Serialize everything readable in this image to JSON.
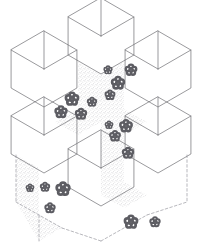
{
  "figure": {
    "title": "Isometric hexagonal tiling",
    "medium": "pen and ink line art",
    "background_color": "#ffffff",
    "line_color": "#6e6e72",
    "dashed_line_color": "#9a9aa0",
    "stipple_color": "#7b7b80",
    "motif_color": "#5d5d63",
    "canvas": {
      "width": 203,
      "height": 245
    },
    "counts": {
      "hexagons": 6,
      "stippled_faces": 7,
      "flower_motifs": 18,
      "dashed_segments": 7
    }
  },
  "geometry": {
    "hexagons": [
      {
        "name": "hexagon-top-center",
        "cx": 101,
        "cy": 36,
        "fill": "plain"
      },
      {
        "name": "hexagon-upper-left",
        "cx": 44,
        "cy": 69,
        "fill": "plain"
      },
      {
        "name": "hexagon-upper-right",
        "cx": 158,
        "cy": 69,
        "fill": "plain"
      },
      {
        "name": "hexagon-lower-left",
        "cx": 44,
        "cy": 135,
        "fill": "plain"
      },
      {
        "name": "hexagon-lower-right",
        "cx": 158,
        "cy": 135,
        "fill": "plain"
      },
      {
        "name": "hexagon-bottom-center",
        "cx": 101,
        "cy": 168,
        "fill": "plain"
      }
    ],
    "hexagon_radius": 38,
    "stippled_faces": [
      {
        "name": "stipple-face-upper-center-left",
        "points": "78,62 101,75 101,122 78,109"
      },
      {
        "name": "stipple-face-upper-center-right",
        "points": "101,75 124,62 124,109 101,122"
      },
      {
        "name": "stipple-face-center-top-rhombus",
        "points": "78,109 101,96 124,109 101,122"
      },
      {
        "name": "stipple-face-mid-left-rhombus",
        "points": "55,122 78,109 101,122 78,135"
      },
      {
        "name": "stipple-face-mid-right-rhombus",
        "points": "124,109 147,122 124,135 101,122"
      },
      {
        "name": "stipple-face-lower-center",
        "points": "101,122 124,135 124,182 101,195"
      },
      {
        "name": "stipple-face-lower-left-wall",
        "points": "16,155 39,168 39,215 16,202"
      },
      {
        "name": "stipple-face-floor-left",
        "points": "16,202 39,215 62,228 39,241"
      },
      {
        "name": "stipple-face-floor-right",
        "points": "124,182 147,195 124,208 101,195"
      }
    ],
    "dashed_segments": [
      {
        "name": "dashed-bottom-left-vertical",
        "x1": 16,
        "y1": 155,
        "x2": 16,
        "y2": 202
      },
      {
        "name": "dashed-bottom-left-floor-a",
        "x1": 16,
        "y1": 202,
        "x2": 62,
        "y2": 228
      },
      {
        "name": "dashed-bottom-left-floor-b",
        "x1": 39,
        "y1": 215,
        "x2": 39,
        "y2": 241
      },
      {
        "name": "dashed-bottom-center-floor",
        "x1": 62,
        "y1": 228,
        "x2": 101,
        "y2": 241
      },
      {
        "name": "dashed-bottom-right-floor-a",
        "x1": 101,
        "y1": 241,
        "x2": 147,
        "y2": 215
      },
      {
        "name": "dashed-bottom-right-vertical",
        "x1": 187,
        "y1": 155,
        "x2": 187,
        "y2": 202
      },
      {
        "name": "dashed-bottom-right-floor-b",
        "x1": 147,
        "y1": 215,
        "x2": 187,
        "y2": 202
      }
    ],
    "flower_motifs": [
      {
        "name": "flower-1",
        "cx": 72,
        "cy": 99,
        "r": 6.0
      },
      {
        "name": "flower-2",
        "cx": 61,
        "cy": 112,
        "r": 5.4
      },
      {
        "name": "flower-3",
        "cx": 81,
        "cy": 114,
        "r": 5.0
      },
      {
        "name": "flower-4",
        "cx": 92,
        "cy": 102,
        "r": 4.2
      },
      {
        "name": "flower-5",
        "cx": 118,
        "cy": 83,
        "r": 5.8
      },
      {
        "name": "flower-6",
        "cx": 131,
        "cy": 70,
        "r": 5.2
      },
      {
        "name": "flower-7",
        "cx": 110,
        "cy": 95,
        "r": 4.4
      },
      {
        "name": "flower-8",
        "cx": 108,
        "cy": 70,
        "r": 3.8
      },
      {
        "name": "flower-9",
        "cx": 126,
        "cy": 126,
        "r": 5.6
      },
      {
        "name": "flower-10",
        "cx": 115,
        "cy": 136,
        "r": 4.8
      },
      {
        "name": "flower-11",
        "cx": 128,
        "cy": 153,
        "r": 5.0
      },
      {
        "name": "flower-12",
        "cx": 109,
        "cy": 125,
        "r": 3.6
      },
      {
        "name": "flower-13",
        "cx": 63,
        "cy": 189,
        "r": 6.2
      },
      {
        "name": "flower-14",
        "cx": 45,
        "cy": 187,
        "r": 4.2
      },
      {
        "name": "flower-15",
        "cx": 50,
        "cy": 208,
        "r": 4.6
      },
      {
        "name": "flower-16",
        "cx": 131,
        "cy": 222,
        "r": 6.0
      },
      {
        "name": "flower-17",
        "cx": 155,
        "cy": 222,
        "r": 4.6
      },
      {
        "name": "flower-18",
        "cx": 30,
        "cy": 188,
        "r": 3.6
      }
    ]
  }
}
